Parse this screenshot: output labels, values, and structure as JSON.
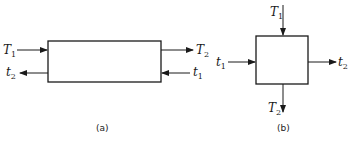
{
  "diagram_a": {
    "caption": "(a)",
    "labels": {
      "left_in": {
        "main": "T",
        "sub": "1"
      },
      "left_out": {
        "main": "t",
        "sub": "2"
      },
      "right_out": {
        "main": "T",
        "sub": "2"
      },
      "right_in": {
        "main": "t",
        "sub": "1"
      }
    }
  },
  "diagram_b": {
    "caption": "(b)",
    "labels": {
      "top_in": {
        "main": "T",
        "sub": "1"
      },
      "bottom_out": {
        "main": "T",
        "sub": "2"
      },
      "left_in": {
        "main": "t",
        "sub": "1"
      },
      "right_out": {
        "main": "t",
        "sub": "2"
      }
    }
  },
  "colors": {
    "stroke": "#1a1a1a",
    "background": "#ffffff"
  }
}
